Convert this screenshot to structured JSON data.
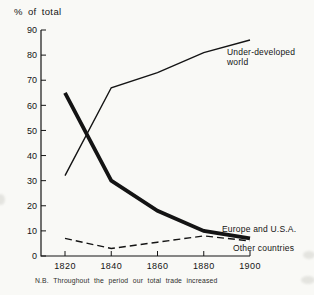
{
  "figure": {
    "y_axis_title": "% of total",
    "note": "N.B. Throughout the period our total trade increased"
  },
  "chart_data": {
    "type": "line",
    "title": "",
    "ylabel": "% of total",
    "xlabel": "",
    "x": [
      1820,
      1840,
      1860,
      1880,
      1900
    ],
    "xticks": [
      "1820",
      "1840",
      "1860",
      "1880",
      "1900"
    ],
    "ylim": [
      0,
      90
    ],
    "ytick_step": 10,
    "grid": false,
    "legend_position": "inline-labels-right",
    "series": [
      {
        "name": "Under-developed world",
        "style": "solid-thin",
        "values": [
          32,
          67,
          73,
          81,
          86
        ]
      },
      {
        "name": "Europe and U.S.A.",
        "style": "solid-thick",
        "values": [
          65,
          30,
          18,
          10,
          7
        ]
      },
      {
        "name": "Other countries",
        "style": "dashed",
        "values": [
          7,
          3,
          5.5,
          8,
          6
        ]
      }
    ],
    "annotation": "N.B. Throughout the period our total trade increased"
  },
  "colors": {
    "background": "#f9f9f6",
    "ink": "#141414"
  }
}
